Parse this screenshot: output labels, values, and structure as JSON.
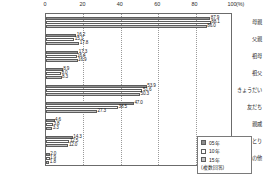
{
  "chart_data": {
    "type": "bar",
    "orientation": "horizontal",
    "title": "",
    "xlabel": "(%)",
    "ylabel": "",
    "xlim": [
      0,
      100
    ],
    "xticks": [
      0,
      20,
      40,
      60,
      80,
      100
    ],
    "xtick_labels": [
      "0",
      "20",
      "40",
      "60",
      "80",
      "100"
    ],
    "x_unit": "(%)",
    "grid": true,
    "legend_position": "bottom-right",
    "note": "(複数回答)",
    "categories": [
      "母親",
      "父親",
      "祖母",
      "祖父",
      "きょうだい",
      "友だち",
      "親戚",
      "お子様ひとり",
      "その他"
    ],
    "series": [
      {
        "name": "05年",
        "color": "#8d8d8d",
        "values": [
          87.9,
          16.2,
          17.3,
          8.9,
          53.9,
          47.0,
          4.6,
          14.3,
          2.0
        ]
      },
      {
        "name": "10年",
        "color": "#ffffff",
        "values": [
          88.1,
          15.1,
          16.4,
          8.0,
          51.6,
          38.5,
          3.8,
          12.5,
          1.9
        ]
      },
      {
        "name": "15年",
        "color": "#c2c2c2",
        "values": [
          86.0,
          17.8,
          16.9,
          8.3,
          50.3,
          27.3,
          3.3,
          12.0,
          1.8
        ]
      }
    ],
    "value_labels": [
      [
        "87.9",
        "88.1",
        "86.0"
      ],
      [
        "16.2",
        "15.1",
        "17.8"
      ],
      [
        "17.3",
        "16.4",
        "16.9"
      ],
      [
        "8.9",
        "8.0",
        "8.3"
      ],
      [
        "53.9",
        "51.6",
        "50.3"
      ],
      [
        "47.0",
        "38.5",
        "27.3"
      ],
      [
        "4.6",
        "3.8",
        "3.3"
      ],
      [
        "14.3",
        "12.5",
        "12.0"
      ],
      [
        "2.0",
        "1.9",
        "1.8"
      ]
    ]
  },
  "legend": {
    "items": [
      {
        "label": "05年",
        "key": "s05"
      },
      {
        "label": "10年",
        "key": "s10"
      },
      {
        "label": "15年",
        "key": "s15"
      }
    ],
    "note": "(複数回答)"
  }
}
